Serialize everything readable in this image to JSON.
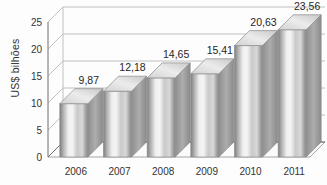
{
  "chart_data": {
    "type": "bar",
    "title": "",
    "subtitle": "",
    "xlabel": "",
    "ylabel": "US$ bilhões",
    "categories": [
      "2006",
      "2007",
      "2008",
      "2009",
      "2010",
      "2011"
    ],
    "values": [
      9.87,
      12.18,
      14.65,
      15.41,
      20.63,
      23.56
    ],
    "value_labels": [
      "9,87",
      "12,18",
      "14,65",
      "15,41",
      "20,63",
      "23,56"
    ],
    "ylim": [
      0,
      25
    ],
    "ytick_values": [
      0,
      5,
      10,
      15,
      20,
      25
    ],
    "ytick_labels": [
      "0",
      "5",
      "10",
      "15",
      "20",
      "25"
    ],
    "grid": true,
    "grid_axis": "y",
    "legend": false,
    "legend_position": "none",
    "style": "3d-column",
    "decimal_separator": ",",
    "series": [
      {
        "name": "US$ bilhões",
        "values": [
          9.87,
          12.18,
          14.65,
          15.41,
          20.63,
          23.56
        ]
      }
    ]
  },
  "colors": {
    "background": "#fdfdfd",
    "axis": "#6e6e6e",
    "gridline": "#b9b9b9",
    "bar_light": "#f2f2f2",
    "bar_mid": "#c2c2c2",
    "bar_dark": "#7d7d7d",
    "bar_top": "#e2e2e2",
    "bar_side": "#9b9b9b",
    "text": "#2b2b2b"
  }
}
